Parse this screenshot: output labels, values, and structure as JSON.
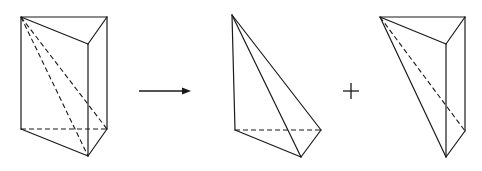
{
  "diagram": {
    "figures": [
      {
        "name": "triangular-prism",
        "role": "whole"
      },
      {
        "name": "tetrahedron",
        "role": "part-1"
      },
      {
        "name": "remaining-solid",
        "role": "part-2"
      }
    ],
    "operators": {
      "arrow": "→",
      "plus": "+"
    },
    "colors": {
      "stroke": "#1a1a1a",
      "background": "#ffffff"
    }
  }
}
